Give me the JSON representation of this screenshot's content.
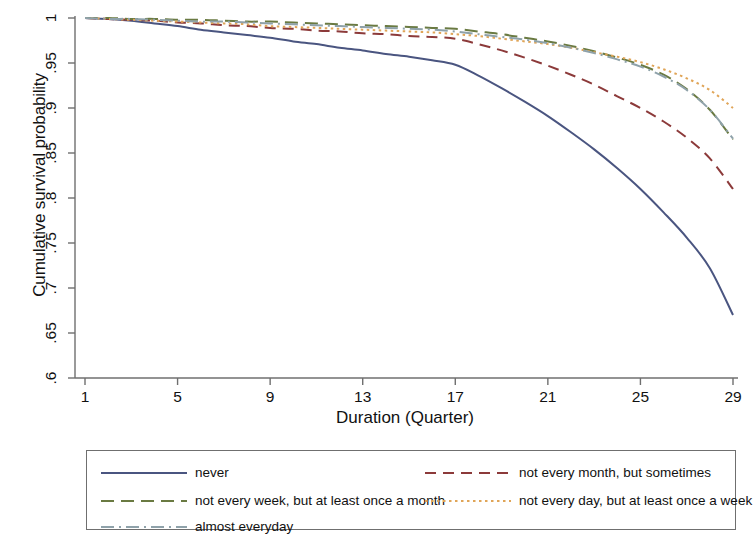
{
  "chart_data": {
    "type": "line",
    "title": "",
    "subtitle": "",
    "xlabel": "Duration (Quarter)",
    "ylabel": "Cumulative survival probability",
    "xlim": [
      1,
      29
    ],
    "ylim": [
      0.6,
      1.0
    ],
    "xticks": [
      1,
      5,
      9,
      13,
      17,
      21,
      25,
      29
    ],
    "xtick_labels": [
      "1",
      "5",
      "9",
      "13",
      "17",
      "21",
      "25",
      "29"
    ],
    "yticks": [
      0.6,
      0.65,
      0.7,
      0.75,
      0.8,
      0.85,
      0.9,
      0.95,
      1.0
    ],
    "ytick_labels": [
      ".6",
      ".65",
      ".7",
      ".75",
      ".8",
      ".85",
      ".9",
      ".95",
      "1"
    ],
    "grid": false,
    "legend_position": "below-plot",
    "x": [
      1,
      2,
      3,
      4,
      5,
      6,
      7,
      8,
      9,
      10,
      11,
      12,
      13,
      14,
      15,
      16,
      17,
      18,
      19,
      20,
      21,
      22,
      23,
      24,
      25,
      26,
      27,
      28,
      29
    ],
    "series": [
      {
        "name": "never",
        "color": "#4a5580",
        "dash": "solid",
        "values": [
          1.0,
          0.999,
          0.997,
          0.994,
          0.991,
          0.987,
          0.984,
          0.981,
          0.978,
          0.974,
          0.971,
          0.967,
          0.964,
          0.96,
          0.957,
          0.953,
          0.948,
          0.936,
          0.922,
          0.907,
          0.891,
          0.873,
          0.854,
          0.833,
          0.81,
          0.784,
          0.756,
          0.722,
          0.67
        ]
      },
      {
        "name": "not every month, but sometimes",
        "color": "#8c3a3a",
        "dash": "long-dash",
        "values": [
          1.0,
          0.999,
          0.998,
          0.997,
          0.995,
          0.994,
          0.992,
          0.991,
          0.989,
          0.988,
          0.986,
          0.985,
          0.983,
          0.982,
          0.98,
          0.979,
          0.977,
          0.971,
          0.964,
          0.956,
          0.947,
          0.937,
          0.926,
          0.913,
          0.9,
          0.885,
          0.867,
          0.844,
          0.81
        ]
      },
      {
        "name": "not every week, but at least once a month",
        "color": "#6a7a42",
        "dash": "dash",
        "values": [
          1.0,
          1.0,
          0.999,
          0.999,
          0.998,
          0.998,
          0.997,
          0.996,
          0.996,
          0.995,
          0.994,
          0.993,
          0.992,
          0.991,
          0.99,
          0.989,
          0.988,
          0.985,
          0.982,
          0.978,
          0.974,
          0.969,
          0.963,
          0.956,
          0.948,
          0.937,
          0.921,
          0.898,
          0.865
        ]
      },
      {
        "name": "not every day, but at least once a week",
        "color": "#e0a558",
        "dash": "dot",
        "values": [
          1.0,
          0.999,
          0.998,
          0.997,
          0.996,
          0.995,
          0.994,
          0.993,
          0.991,
          0.99,
          0.989,
          0.988,
          0.987,
          0.986,
          0.985,
          0.984,
          0.982,
          0.98,
          0.977,
          0.974,
          0.971,
          0.967,
          0.962,
          0.957,
          0.951,
          0.943,
          0.933,
          0.92,
          0.9
        ]
      },
      {
        "name": "almost everyday",
        "color": "#8fa2aa",
        "dash": "dash-dot",
        "values": [
          1.0,
          0.999,
          0.999,
          0.998,
          0.997,
          0.996,
          0.996,
          0.995,
          0.994,
          0.993,
          0.992,
          0.991,
          0.99,
          0.989,
          0.988,
          0.987,
          0.985,
          0.982,
          0.979,
          0.976,
          0.972,
          0.967,
          0.961,
          0.954,
          0.946,
          0.935,
          0.92,
          0.898,
          0.866
        ]
      }
    ]
  },
  "legend": {
    "entries": [
      {
        "label": "never",
        "color": "#4a5580",
        "dash": "solid"
      },
      {
        "label": "not every month, but sometimes",
        "color": "#8c3a3a",
        "dash": "long-dash"
      },
      {
        "label": "not every week, but at least once a month",
        "color": "#6a7a42",
        "dash": "dash"
      },
      {
        "label": "not every day, but at least once a week",
        "color": "#e0a558",
        "dash": "dot"
      },
      {
        "label": "almost everyday",
        "color": "#8fa2aa",
        "dash": "dash-dot"
      }
    ]
  },
  "axis": {
    "color": "#6f6f6f"
  }
}
